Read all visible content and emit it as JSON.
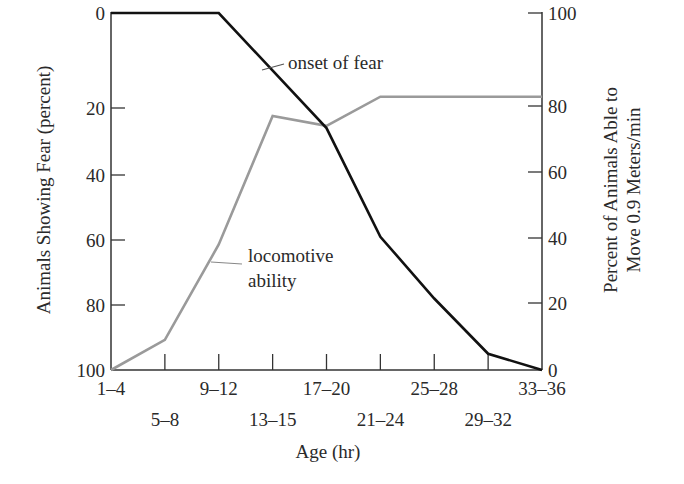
{
  "chart_data": {
    "type": "line",
    "title": "",
    "xlabel": "Age (hr)",
    "ylabel_left": "Animals Showing Fear (percent)",
    "ylabel_right_line1": "Percent of Animals Able to",
    "ylabel_right_line2": "Move 0.9 Meters/min",
    "categories": [
      "1–4",
      "5–8",
      "9–12",
      "13–15",
      "17–20",
      "21–24",
      "25–28",
      "29–32",
      "33–36"
    ],
    "left_axis": {
      "ticks": [
        0,
        20,
        40,
        60,
        80,
        100
      ],
      "inverted": true,
      "ylim": [
        0,
        100
      ]
    },
    "right_axis": {
      "ticks": [
        0,
        20,
        40,
        60,
        80,
        100
      ],
      "ylim": [
        0,
        100
      ]
    },
    "grid": false,
    "series": [
      {
        "name": "onset of fear",
        "axis": "left",
        "color": "#111111",
        "values": [
          0,
          null,
          0,
          null,
          26,
          59,
          78,
          95,
          100
        ]
      },
      {
        "name": "locomotive ability",
        "axis": "right",
        "color": "#9a9a9a",
        "values": [
          0,
          9,
          38,
          77,
          74,
          82,
          82,
          82,
          82
        ]
      }
    ],
    "annotations": [
      {
        "text": "onset of fear",
        "series": "onset of fear"
      },
      {
        "text_line1": "locomotive",
        "text_line2": "ability",
        "series": "locomotive ability"
      }
    ]
  }
}
